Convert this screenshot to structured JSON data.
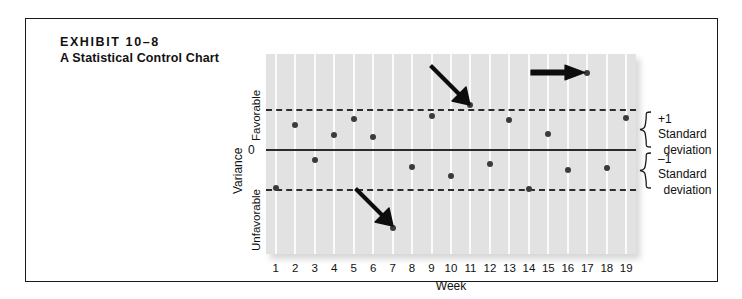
{
  "exhibit": {
    "number_label": "EXHIBIT 10–8",
    "title": "A Statistical Control Chart"
  },
  "annotations": {
    "upper_band_label_line1": "+1 Standard",
    "upper_band_label_line2": "deviation",
    "lower_band_label_line1": "–1 Standard",
    "lower_band_label_line2": "deviation"
  },
  "colors": {
    "plot_background": "#e2e2e2",
    "gridline": "#fbfbfb",
    "line": "#2b2b2b",
    "dot": "#3b3b3b",
    "border": "#1a1a1a",
    "text": "#111111"
  },
  "chart_data": {
    "type": "scatter",
    "title": "A Statistical Control Chart",
    "xlabel": "Week",
    "ylabel": "Variance",
    "x": [
      1,
      2,
      3,
      4,
      5,
      6,
      7,
      8,
      9,
      10,
      11,
      12,
      13,
      14,
      15,
      16,
      17,
      18,
      19
    ],
    "categories": [
      "1",
      "2",
      "3",
      "4",
      "5",
      "6",
      "7",
      "8",
      "9",
      "10",
      "11",
      "12",
      "13",
      "14",
      "15",
      "16",
      "17",
      "18",
      "19"
    ],
    "values": [
      -0.96,
      0.62,
      -0.24,
      0.38,
      0.77,
      0.32,
      -1.95,
      -0.42,
      0.84,
      -0.66,
      1.12,
      -0.34,
      0.74,
      -0.98,
      0.4,
      -0.5,
      1.92,
      -0.44,
      0.79
    ],
    "y_axis_ticks": [
      {
        "label": "Favorable",
        "position": "upper"
      },
      {
        "label": "0",
        "position": "center"
      },
      {
        "label": "Unfavorable",
        "position": "lower"
      }
    ],
    "reference_lines": [
      {
        "name": "upper-control-limit",
        "value": 1.0,
        "style": "dashed",
        "label": "+1 Standard deviation"
      },
      {
        "name": "center-line",
        "value": 0,
        "style": "solid",
        "label": "0"
      },
      {
        "name": "lower-control-limit",
        "value": -1.0,
        "style": "dashed",
        "label": "–1 Standard deviation"
      }
    ],
    "ylim": [
      -2.6,
      2.4
    ],
    "grid": "vertical",
    "legend": "none",
    "callouts": [
      {
        "week": 11,
        "direction": "down-right",
        "note": "point at upper control limit"
      },
      {
        "week": 17,
        "direction": "right",
        "note": "point above upper control limit"
      },
      {
        "week": 7,
        "direction": "down-right",
        "note": "point below lower control limit"
      }
    ]
  }
}
